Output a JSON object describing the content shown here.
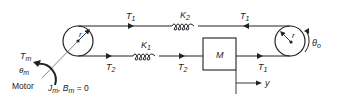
{
  "diagram": {
    "type": "mechanical-system",
    "labels": {
      "motor": "Motor",
      "motor_torque": "T",
      "motor_torque_sub": "m",
      "motor_angle": "θ",
      "motor_angle_sub": "m",
      "motor_params_J": "J",
      "motor_params_J_sub": "m",
      "motor_params_B": ", B",
      "motor_params_B_sub": "m",
      "motor_params_eq": " = 0",
      "left_pulley_radius": "r",
      "right_pulley_radius": "r",
      "output_angle": "θ",
      "output_angle_sub": "o",
      "top_tension_left": "T",
      "top_tension_left_sub": "1",
      "top_tension_right": "T",
      "top_tension_right_sub": "1",
      "spring_top": "K",
      "spring_top_sub": "2",
      "spring_bottom": "K",
      "spring_bottom_sub": "1",
      "bottom_tension_left": "T",
      "bottom_tension_left_sub": "2",
      "bottom_tension_mid": "T",
      "bottom_tension_mid_sub": "2",
      "bottom_tension_right": "T",
      "bottom_tension_right_sub": "1",
      "mass": "M",
      "displacement": "y"
    },
    "colors": {
      "line": "#222222",
      "text": "#222222",
      "gray_text": "#666666"
    }
  }
}
